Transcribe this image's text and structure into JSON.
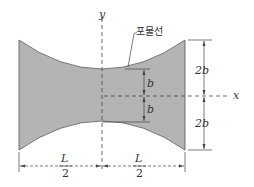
{
  "diagram": {
    "labels": {
      "x_axis": "x",
      "y_axis": "y",
      "curve_name": "포물선",
      "half_width_neck_top": "b",
      "half_width_neck_bottom": "b",
      "end_top": "2b",
      "end_bottom": "2b",
      "left_half_num": "L",
      "left_half_den": "2",
      "right_half_num": "L",
      "right_half_den": "2"
    },
    "colors": {
      "fill": "#b4b4b4",
      "stroke": "#444444",
      "dim": "#444444"
    }
  }
}
